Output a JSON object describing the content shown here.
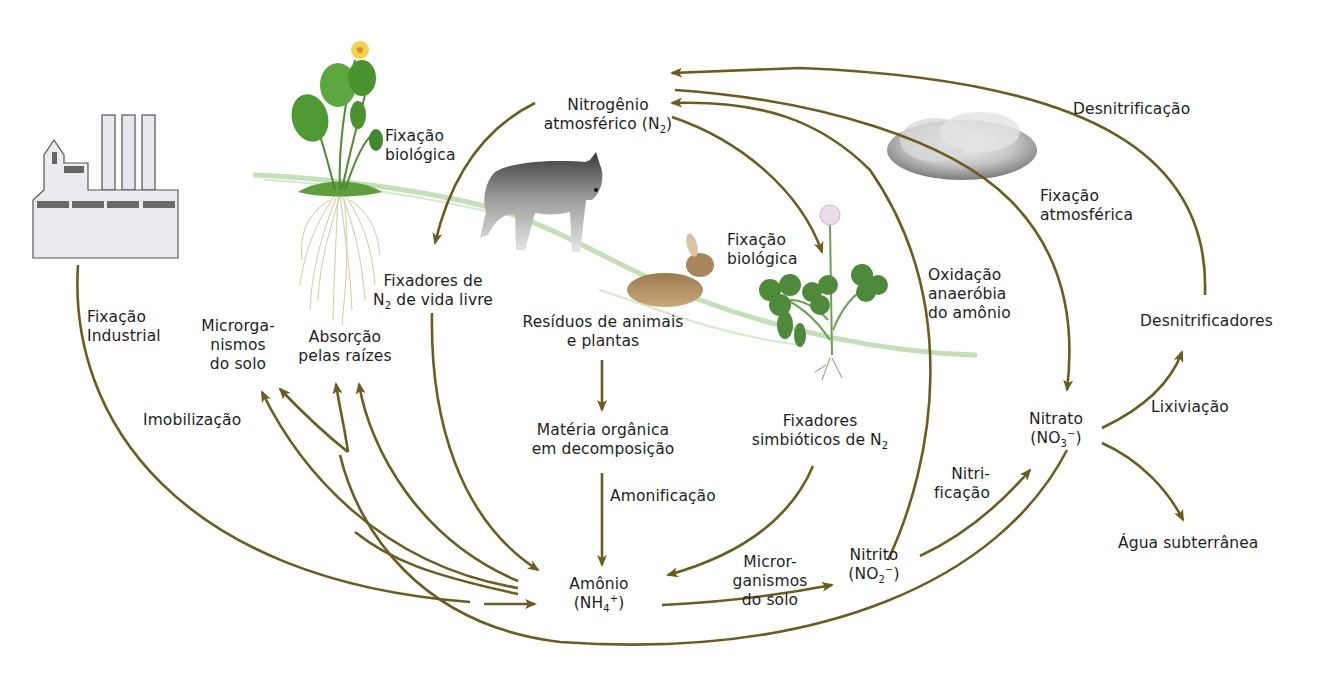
{
  "diagram": {
    "arrow_color": "#6b5d1e",
    "nodes": {
      "atmospheric_n2": {
        "line1": "Nitrogênio",
        "line2_prefix": "atmosférico  (N",
        "line2_sub": "2",
        "line2_suffix": ")"
      },
      "ammonium": {
        "line1": "Amônio",
        "line2_prefix": "(NH",
        "line2_sub": "4",
        "line2_sup": "+",
        "line2_suffix": ")"
      },
      "nitrite": {
        "line1": "Nitrito",
        "line2_prefix": "(NO",
        "line2_sub": "2",
        "line2_sup": "−",
        "line2_suffix": ")"
      },
      "nitrate": {
        "line1": "Nitrato",
        "line2_prefix": "(NO",
        "line2_sub": "3",
        "line2_sup": "−",
        "line2_suffix": ")"
      },
      "residues": {
        "line1": "Resíduos de animais",
        "line2": "e plantas"
      },
      "organic_matter": {
        "line1": "Matéria orgânica",
        "line2": "em decomposição"
      },
      "free_living_fixers": {
        "line1": "Fixadores de",
        "line2_prefix": "N",
        "line2_sub": "2",
        "line2_suffix": " de vida livre"
      },
      "symbiotic_fixers": {
        "line1": "Fixadores",
        "line2_prefix": "simbióticos de N",
        "line2_sub": "2"
      },
      "soil_microorganisms_left": {
        "line1": "Microrga-",
        "line2": "nismos",
        "line3": "do solo"
      },
      "root_absorption": {
        "line1": "Absorção",
        "line2": "pelas raízes"
      },
      "denitrifiers": {
        "label": "Desnitrificadores"
      },
      "groundwater": {
        "label": "Água subterrânea"
      }
    },
    "processes": {
      "industrial_fixation": {
        "line1": "Fixação",
        "line2": "Industrial"
      },
      "biological_fixation_plant": {
        "line1": "Fixação",
        "line2": "biológica"
      },
      "biological_fixation_clover": {
        "line1": "Fixação",
        "line2": "biológica"
      },
      "atmospheric_fixation": {
        "line1": "Fixação",
        "line2": "atmosférica"
      },
      "denitrification": {
        "label": "Desnitrificação"
      },
      "anammox": {
        "line1": "Oxidação",
        "line2": "anaeróbia",
        "line3": "do amônio"
      },
      "immobilization": {
        "label": "Imobilização"
      },
      "ammonification": {
        "label": "Amonificação"
      },
      "soil_microorganisms_mid": {
        "line1": "Micror-",
        "line2": "ganismos",
        "line3": "do solo"
      },
      "nitrification": {
        "line1": "Nitri-",
        "line2": "ficação"
      },
      "leaching": {
        "label": "Lixiviação"
      }
    },
    "illustrations": [
      "factory-icon",
      "plant-with-roots",
      "wolf",
      "rabbit",
      "clover",
      "cloud"
    ]
  }
}
